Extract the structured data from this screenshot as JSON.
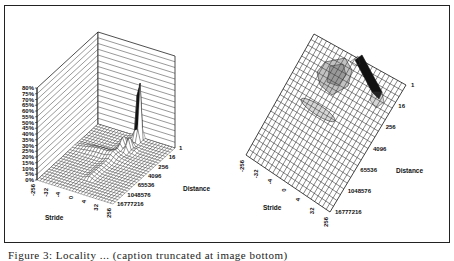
{
  "figure": {
    "caption": "Figure 3: Locality ... (caption truncated at image bottom)"
  },
  "chart_data": [
    {
      "type": "surface3d",
      "title": "",
      "xlabel": "Stride",
      "ylabel": "Distance",
      "zlabel": "",
      "stride_ticks": [
        "-256",
        "-32",
        "-4",
        "0",
        "4",
        "32",
        "256"
      ],
      "distance_ticks": [
        "1",
        "16",
        "256",
        "4096",
        "65536",
        "1048576",
        "16777216"
      ],
      "z_ticks": [
        "0%",
        "5%",
        "10%",
        "15%",
        "20%",
        "25%",
        "30%",
        "35%",
        "40%",
        "45%",
        "50%",
        "55%",
        "60%",
        "65%",
        "70%",
        "75%",
        "80%"
      ],
      "zlim": [
        0,
        80
      ],
      "peaks": [
        {
          "stride": "0 (near +1)",
          "distance": "1-16",
          "value_pct": 70,
          "note": "dominant sharp spike"
        },
        {
          "stride": "small positive",
          "distance": "16-256",
          "value_pct": 12,
          "note": "secondary ridge cluster"
        },
        {
          "stride": "negative to 0",
          "distance": "256-4096",
          "value_pct": 5,
          "note": "low ridge band"
        }
      ]
    },
    {
      "type": "contour_projection",
      "title": "",
      "xlabel": "Stride",
      "ylabel": "Distance",
      "stride_ticks": [
        "-256",
        "-32",
        "-4",
        "0",
        "4",
        "32",
        "256"
      ],
      "distance_ticks": [
        "1",
        "16",
        "256",
        "4096",
        "65536",
        "1048576",
        "16777216"
      ],
      "note": "Top-down view of the same surface; dark band near distance 1-16 at positive small strides, shaded blobs at mid distances"
    }
  ],
  "left": {
    "stride_label": "Stride",
    "distance_label": "Distance",
    "stride_ticks": [
      "-256",
      "-32",
      "-4",
      "0",
      "4",
      "32",
      "256"
    ],
    "distance_ticks": [
      "1",
      "16",
      "256",
      "4096",
      "65536",
      "1048576",
      "16777216"
    ],
    "z_ticks": [
      "0%",
      "5%",
      "10%",
      "15%",
      "20%",
      "25%",
      "30%",
      "35%",
      "40%",
      "45%",
      "50%",
      "55%",
      "60%",
      "65%",
      "70%",
      "75%",
      "80%"
    ]
  },
  "right": {
    "stride_label": "Stride",
    "distance_label": "Distance",
    "stride_ticks": [
      "-256",
      "-32",
      "-4",
      "0",
      "4",
      "32",
      "256"
    ],
    "distance_ticks": [
      "1",
      "16",
      "256",
      "4096",
      "65536",
      "1048576",
      "16777216"
    ]
  }
}
